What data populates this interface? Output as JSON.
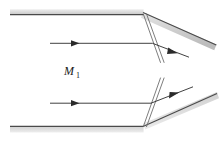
{
  "figure": {
    "background_color": "#ffffff",
    "width": 223,
    "height": 141,
    "labels": [
      {
        "id": "mach-number-upstream",
        "symbol": "M",
        "subscript": "1",
        "x": 64,
        "y": 75,
        "color": "#1a1a1a"
      }
    ],
    "colors": {
      "wall_fill_light": "#e3e3e3",
      "wall_fill_mid": "#cfcfcf",
      "wall_edge": "#4a4a4a",
      "flow_line": "#2b2b2b",
      "wave_line": "#6e6e6e",
      "arrow_fill": "#2b2b2b"
    },
    "walls": [
      {
        "id": "upper-wall-straight",
        "band": "10,9 143,9 143,15 10,15",
        "edge": "M 10 14.6 L 143.5 14.6",
        "fill": "#e0e0e0"
      },
      {
        "id": "upper-wall-deflected",
        "band": "143,12 216,44 214,50 141,18",
        "edge": "M 143 13 L 215.5 45.5",
        "fill": "#cfcfcf"
      },
      {
        "id": "lower-wall-straight",
        "band": "10,126 143,126 143,133 10,133",
        "edge": "M 10 126.4 L 143.5 126.4",
        "fill": "#e0e0e0"
      },
      {
        "id": "lower-wall-deflected",
        "band": "143,123 216,92 218,99 145,130",
        "edge": "M 143 126.4 L 216 94",
        "fill": "#cfcfcf"
      }
    ],
    "flow_arrows": [
      {
        "id": "upper-incoming-streamline",
        "path": "M 50 43.3 L 152 43.3",
        "head": {
          "x": 78,
          "y": 43.3,
          "angle": 0
        }
      },
      {
        "id": "upper-deflected-streamline",
        "path": "M 152 43.3 L 188 57",
        "head": {
          "x": 176,
          "y": 52.4,
          "angle": 20.8
        }
      },
      {
        "id": "lower-incoming-streamline",
        "path": "M 50 103.2 L 150 103.2",
        "head": {
          "x": 78,
          "y": 103.2,
          "angle": 0
        }
      },
      {
        "id": "lower-deflected-streamline",
        "path": "M 150 103.2 L 192 87",
        "head": {
          "x": 178,
          "y": 92.4,
          "angle": -21.1
        }
      }
    ],
    "wave_fans": [
      {
        "id": "upper-expansion-wave-first",
        "path": "M 143 14 L 161 63"
      },
      {
        "id": "upper-expansion-wave-second",
        "path": "M 146 14 L 165 63"
      },
      {
        "id": "lower-expansion-wave-first",
        "path": "M 143 126 L 161 78"
      },
      {
        "id": "lower-expansion-wave-second",
        "path": "M 146 126 L 165 78"
      }
    ]
  }
}
